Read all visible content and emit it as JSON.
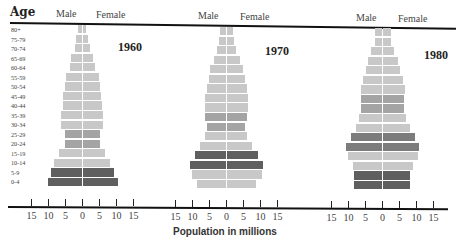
{
  "chart_data": {
    "type": "bar",
    "subtype": "population-pyramid",
    "title": "",
    "xlabel": "Population in millions",
    "ylabel": "Age",
    "xlim": [
      -15,
      15
    ],
    "x_ticks": [
      "15",
      "10",
      "5",
      "0",
      "5",
      "10",
      "15"
    ],
    "legend": [
      "Male",
      "Female"
    ],
    "categories": [
      "80+",
      "75-79",
      "70-74",
      "65-69",
      "60-64",
      "55-59",
      "50-54",
      "45-49",
      "40-44",
      "35-39",
      "30-34",
      "25-29",
      "20-24",
      "15-19",
      "10-14",
      "5-9",
      "0-4"
    ],
    "panels": [
      {
        "year": "1960",
        "series": [
          {
            "name": "Male",
            "values": [
              1,
              1.5,
              2,
              3,
              3.5,
              4.5,
              5,
              5.5,
              5.5,
              6,
              6,
              5,
              5,
              6.5,
              8,
              9,
              10
            ]
          },
          {
            "name": "Female",
            "values": [
              1,
              1.5,
              2.2,
              3.2,
              3.8,
              4.8,
              5.2,
              5.5,
              5.8,
              6,
              6,
              5,
              5,
              6.5,
              8,
              9.3,
              10.3
            ]
          }
        ],
        "shade": [
          "l",
          "l",
          "l",
          "l",
          "l",
          "l",
          "l",
          "l",
          "l",
          "l",
          "l",
          "m",
          "m",
          "l",
          "l",
          "d",
          "d"
        ]
      },
      {
        "year": "1970",
        "series": [
          {
            "name": "Male",
            "values": [
              1.5,
              2,
              2.5,
              3.5,
              4.5,
              5,
              5.5,
              6,
              6,
              6,
              5.5,
              6,
              7.5,
              9,
              10.5,
              10,
              8.5
            ]
          },
          {
            "name": "Female",
            "values": [
              1.8,
              2.2,
              2.8,
              4,
              4.8,
              5.5,
              6,
              6.3,
              6.3,
              6,
              5.5,
              6,
              7.5,
              9.2,
              10.8,
              10.3,
              8.8
            ]
          }
        ],
        "shade": [
          "l",
          "l",
          "l",
          "l",
          "l",
          "l",
          "l",
          "l",
          "l",
          "m",
          "m",
          "l",
          "l",
          "d",
          "d",
          "l",
          "l"
        ]
      },
      {
        "year": "1980",
        "series": [
          {
            "name": "Male",
            "values": [
              2,
              2,
              3,
              4,
              4.5,
              5.5,
              6,
              6,
              6,
              6.5,
              7.5,
              9,
              10.5,
              10,
              8.5,
              8,
              8
            ]
          },
          {
            "name": "Female",
            "values": [
              2.5,
              2.5,
              3.5,
              4.5,
              5,
              6,
              6.5,
              6.3,
              6.3,
              7,
              8,
              9.5,
              10.8,
              10.3,
              9,
              8,
              8
            ]
          }
        ],
        "shade": [
          "l",
          "l",
          "l",
          "l",
          "l",
          "l",
          "l",
          "m",
          "m",
          "l",
          "l",
          "dm",
          "dm",
          "l",
          "l",
          "d",
          "d"
        ]
      }
    ]
  },
  "labels": {
    "age_title": "Age",
    "male": "Male",
    "female": "Female",
    "year_1960": "1960",
    "year_1970": "1970",
    "year_1980": "1980",
    "xlabel": "Population in millions"
  },
  "colors": {
    "light": "#c8c8c8",
    "medium": "#a4a4a4",
    "dark_medium": "#7c7c7c",
    "dark": "#5f5f5f",
    "axis": "#111111"
  }
}
